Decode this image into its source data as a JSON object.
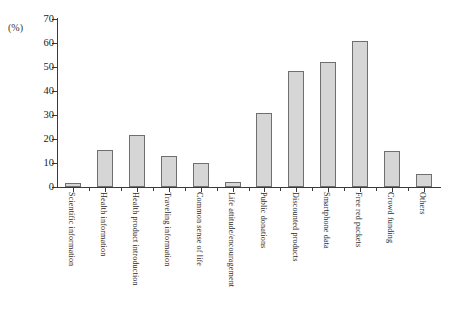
{
  "chart_data": {
    "type": "bar",
    "title": "",
    "subtitle": "",
    "xlabel": "",
    "ylabel": "(%)",
    "ylim": [
      0,
      70
    ],
    "yticks": [
      0,
      10,
      20,
      30,
      40,
      50,
      60,
      70
    ],
    "grid": false,
    "legend": false,
    "bar_fill_color": "#d6d6d6",
    "bar_edge_color": "#6f6f6f",
    "axis_color": "#3a3a3a",
    "categories": [
      "Scientific information",
      "Health information",
      "Health product introduction",
      "Traveling information",
      "Common sense of life",
      "Life attitude/encouragement",
      "Public donations",
      "Discounted products",
      "Smartphone data",
      "Free red packets",
      "Crowd funding",
      "Others"
    ],
    "values": [
      1.5,
      15.5,
      21.5,
      13,
      10,
      2,
      31,
      48.5,
      52,
      61,
      15,
      5.5
    ]
  }
}
